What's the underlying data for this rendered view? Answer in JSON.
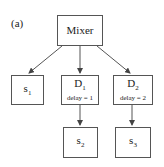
{
  "figure_label": "(a)",
  "nodes": {
    "mixer": {
      "label": "Mixer"
    },
    "s1": {
      "base": "s",
      "index": "1"
    },
    "d1": {
      "base": "D",
      "index": "1",
      "detail": "delay = 1"
    },
    "d2": {
      "base": "D",
      "index": "2",
      "detail": "delay = 2"
    },
    "s2": {
      "base": "s",
      "index": "2"
    },
    "s3": {
      "base": "s",
      "index": "3"
    }
  },
  "edges": [
    {
      "from": "Mixer",
      "to": "s1"
    },
    {
      "from": "Mixer",
      "to": "D1"
    },
    {
      "from": "Mixer",
      "to": "D2"
    },
    {
      "from": "D1",
      "to": "s2"
    },
    {
      "from": "D2",
      "to": "s3"
    }
  ]
}
